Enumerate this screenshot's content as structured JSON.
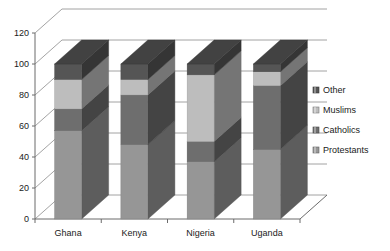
{
  "chart_data": {
    "type": "bar",
    "subtype": "stacked-column-3d",
    "title": "",
    "subtitle": "",
    "xlabel": "",
    "ylabel": "",
    "categories": [
      "Ghana",
      "Kenya",
      "Nigeria",
      "Uganda"
    ],
    "series": [
      {
        "name": "Protestants",
        "values": [
          57,
          48,
          37,
          45
        ],
        "color": "#969696"
      },
      {
        "name": "Catholics",
        "values": [
          14,
          32,
          13,
          41
        ],
        "color": "#6e6e6e"
      },
      {
        "name": "Muslims",
        "values": [
          19,
          10,
          43,
          9
        ],
        "color": "#bdbdbd"
      },
      {
        "name": "Other",
        "values": [
          10,
          10,
          7,
          5
        ],
        "color": "#555555"
      }
    ],
    "stack_tops": {
      "Ghana": {
        "Protestants": 57,
        "Catholics": 71,
        "Muslims": 90,
        "Other": 100
      },
      "Kenya": {
        "Protestants": 48,
        "Catholics": 80,
        "Muslims": 90,
        "Other": 100
      },
      "Nigeria": {
        "Protestants": 37,
        "Catholics": 50,
        "Muslims": 93,
        "Other": 100
      },
      "Uganda": {
        "Protestants": 45,
        "Catholics": 86,
        "Muslims": 95,
        "Other": 100
      }
    },
    "ylim": [
      0,
      120
    ],
    "ytick_step": 20,
    "ytick_labels": [
      "0",
      "20",
      "40",
      "60",
      "80",
      "100",
      "120"
    ],
    "ytick_values": [
      0,
      20,
      40,
      60,
      80,
      100,
      120
    ],
    "grid": true,
    "legend_position": "right",
    "legend_entries": [
      "Other",
      "Muslims",
      "Catholics",
      "Protestants"
    ]
  },
  "axis": {
    "y": {
      "ticks": [
        {
          "label": "120",
          "value": 120
        },
        {
          "label": "100",
          "value": 100
        },
        {
          "label": "80",
          "value": 80
        },
        {
          "label": "60",
          "value": 60
        },
        {
          "label": "40",
          "value": 40
        },
        {
          "label": "20",
          "value": 20
        },
        {
          "label": "0",
          "value": 0
        }
      ]
    },
    "x": {
      "ticks": [
        {
          "label": "Ghana"
        },
        {
          "label": "Kenya"
        },
        {
          "label": "Nigeria"
        },
        {
          "label": "Uganda"
        }
      ]
    }
  },
  "legend": {
    "items": [
      {
        "label": "Other",
        "color": "#555555"
      },
      {
        "label": "Muslims",
        "color": "#bdbdbd"
      },
      {
        "label": "Catholics",
        "color": "#6e6e6e"
      },
      {
        "label": "Protestants",
        "color": "#969696"
      }
    ]
  },
  "colors": {
    "axis_line": "#6b6b6b",
    "grid_line": "#8c8c8c",
    "background": "#ffffff",
    "text": "#1a1a1a"
  }
}
